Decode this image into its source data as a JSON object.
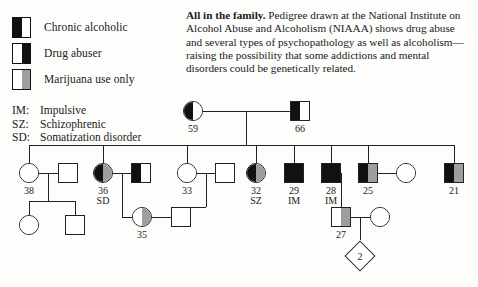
{
  "legend": {
    "items": [
      {
        "label": "Chronic alcoholic",
        "left": "black",
        "right": "white",
        "icon": "half-filled-square-icon"
      },
      {
        "label": "Drug abuser",
        "left": "white",
        "right": "black",
        "icon": "half-filled-square-icon"
      },
      {
        "label": "Marijuana use only",
        "left": "white",
        "right": "gray",
        "icon": "half-filled-square-icon"
      }
    ],
    "abbreviations": [
      {
        "key": "IM:",
        "text": "Impulsive"
      },
      {
        "key": "SZ:",
        "text": "Schizophrenic"
      },
      {
        "key": "SD:",
        "text": "Somatization disorder"
      }
    ]
  },
  "caption": {
    "headline": "All in the family.",
    "body": "  Pedigree drawn at the National Institute on Alcohol Abuse and Alcoholism (NIAAA) shows drug abuse and several types of psychopathology as well as alcoholism—raising the possibility that some addictions and mental disorders could be genetically related."
  },
  "colors": {
    "black": "#111111",
    "gray": "#9e9e9e",
    "white": "#ffffff",
    "stroke": "#222222",
    "background": "#fdfdfb"
  },
  "pedigree": {
    "generation1": [
      {
        "id": "g1-female-59",
        "shape": "circle",
        "age": "59",
        "left": "black",
        "right": "white",
        "note": ""
      },
      {
        "id": "g1-male-66",
        "shape": "square",
        "age": "66",
        "left": "black",
        "right": "white",
        "note": ""
      }
    ],
    "generation2": [
      {
        "id": "g2-female-38",
        "shape": "circle",
        "age": "38",
        "left": "white",
        "right": "white",
        "note": ""
      },
      {
        "id": "g2-spouse-of-38",
        "shape": "square",
        "age": "",
        "left": "white",
        "right": "white",
        "note": ""
      },
      {
        "id": "g2-female-36",
        "shape": "circle",
        "age": "36",
        "left": "black",
        "right": "gray",
        "note": "SD"
      },
      {
        "id": "g2-spouse-of-36",
        "shape": "square",
        "age": "",
        "left": "black",
        "right": "white",
        "note": ""
      },
      {
        "id": "g2-female-33",
        "shape": "circle",
        "age": "33",
        "left": "white",
        "right": "white",
        "note": ""
      },
      {
        "id": "g2-spouse-of-33",
        "shape": "square",
        "age": "",
        "left": "white",
        "right": "white",
        "note": ""
      },
      {
        "id": "g2-female-32",
        "shape": "circle",
        "age": "32",
        "left": "black",
        "right": "gray",
        "note": "SZ"
      },
      {
        "id": "g2-male-29",
        "shape": "square",
        "age": "29",
        "left": "black",
        "right": "black",
        "note": "IM"
      },
      {
        "id": "g2-male-28",
        "shape": "square",
        "age": "28",
        "left": "black",
        "right": "black",
        "note": "IM"
      },
      {
        "id": "g2-male-25",
        "shape": "square",
        "age": "25",
        "left": "black",
        "right": "gray",
        "note": ""
      },
      {
        "id": "g2-spouse-of-25",
        "shape": "circle",
        "age": "",
        "left": "white",
        "right": "white",
        "note": ""
      },
      {
        "id": "g2-male-21",
        "shape": "square",
        "age": "21",
        "left": "black",
        "right": "gray",
        "note": ""
      }
    ],
    "generation3": [
      {
        "id": "g3-female-child",
        "shape": "circle",
        "age": "",
        "left": "white",
        "right": "white",
        "note": ""
      },
      {
        "id": "g3-male-child",
        "shape": "square",
        "age": "",
        "left": "white",
        "right": "white",
        "note": ""
      },
      {
        "id": "g3-female-35",
        "shape": "circle",
        "age": "35",
        "left": "white",
        "right": "gray",
        "note": ""
      },
      {
        "id": "g3-spouse-of-35",
        "shape": "square",
        "age": "",
        "left": "white",
        "right": "white",
        "note": ""
      },
      {
        "id": "g3-male-27",
        "shape": "square",
        "age": "27",
        "left": "white",
        "right": "gray",
        "note": ""
      },
      {
        "id": "g3-spouse-of-27",
        "shape": "circle",
        "age": "",
        "left": "white",
        "right": "white",
        "note": ""
      }
    ],
    "generation4": [
      {
        "id": "g4-sibship-diamond",
        "shape": "diamond",
        "count": "2"
      }
    ]
  }
}
